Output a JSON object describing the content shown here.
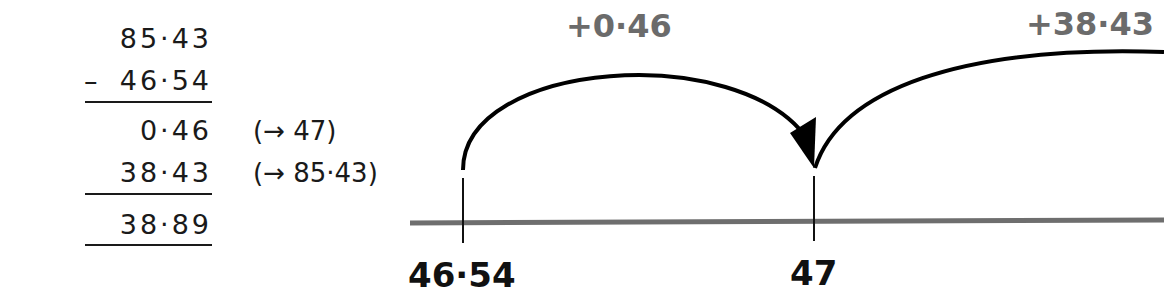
{
  "calculation": {
    "minuend": "85·43",
    "operator": "–",
    "subtrahend": "46·54",
    "steps": [
      {
        "value": "0·46",
        "note": "(→ 47)"
      },
      {
        "value": "38·43",
        "note": "(→ 85·43)"
      }
    ],
    "result": "38·89"
  },
  "number_line": {
    "points": [
      {
        "label": "46·54",
        "x": 463
      },
      {
        "label": "47",
        "x": 814
      }
    ],
    "jumps": [
      {
        "label": "+0·46",
        "from": "46·54",
        "to": "47"
      },
      {
        "label": "+38·43",
        "from": "47",
        "to": "85·43"
      }
    ],
    "colors": {
      "line": "#6e6e6e",
      "arc": "#000000",
      "jump_label": "#6b6b6b",
      "point_label": "#111111"
    }
  }
}
